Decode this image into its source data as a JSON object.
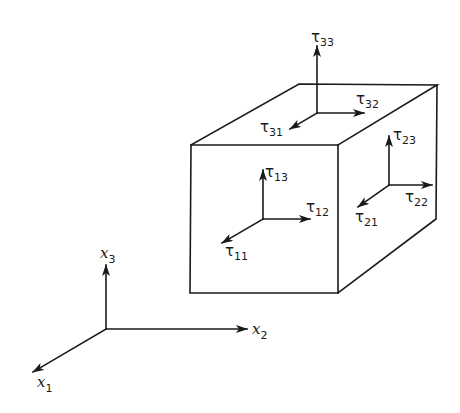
{
  "figure": {
    "colors": {
      "ink": "#1a1a1a",
      "background": "#ffffff"
    }
  },
  "axes": {
    "x1": {
      "symbol": "x",
      "subscript": "1"
    },
    "x2": {
      "symbol": "x",
      "subscript": "2"
    },
    "x3": {
      "symbol": "x",
      "subscript": "3"
    }
  },
  "stresses": {
    "top_face": [
      {
        "symbol": "τ",
        "subscript": "33"
      },
      {
        "symbol": "τ",
        "subscript": "32"
      },
      {
        "symbol": "τ",
        "subscript": "31"
      }
    ],
    "front_face": [
      {
        "symbol": "τ",
        "subscript": "13"
      },
      {
        "symbol": "τ",
        "subscript": "12"
      },
      {
        "symbol": "τ",
        "subscript": "11"
      }
    ],
    "side_face": [
      {
        "symbol": "τ",
        "subscript": "23"
      },
      {
        "symbol": "τ",
        "subscript": "22"
      },
      {
        "symbol": "τ",
        "subscript": "21"
      }
    ]
  }
}
